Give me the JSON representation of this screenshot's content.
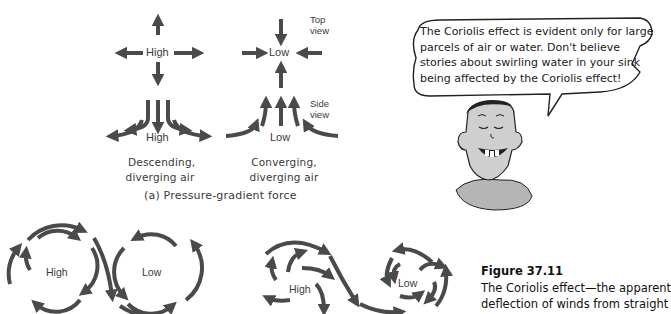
{
  "panel_a": {
    "top_view_high": {
      "label": "High"
    },
    "top_view_low": {
      "label": "Low"
    },
    "top_view_caption": [
      "Top",
      "view"
    ],
    "side_view_high": {
      "label": "High"
    },
    "side_view_low": {
      "label": "Low"
    },
    "side_view_caption": [
      "Side",
      "view"
    ],
    "left_caption": [
      "Descending,",
      "diverging air"
    ],
    "right_caption": [
      "Converging,",
      "diverging air"
    ],
    "panel_title": "(a) Pressure-gradient force"
  },
  "panel_b": {
    "high_label": "High",
    "low_label": "Low"
  },
  "panel_c": {
    "high_label": "High",
    "low_label": "Low"
  },
  "speech_bubble": {
    "lines": [
      "The Coriolis effect is evident only for large",
      "parcels of air or water. Don't believe",
      "stories about swirling water in your sink",
      "being affected by the Coriolis effect!"
    ]
  },
  "figure": {
    "title": "Figure 37.11",
    "caption_lines": [
      "The Coriolis effect—the apparent",
      "deflection of winds from straight"
    ]
  },
  "colors": {
    "arrow": "#4a4a4a",
    "face_fill": "#cfcfcf",
    "shirt_fill": "#b5b5b5"
  }
}
